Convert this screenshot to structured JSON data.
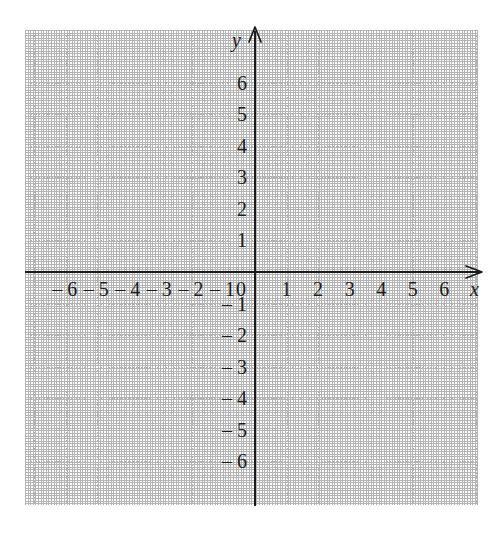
{
  "chart_data": {
    "type": "scatter",
    "title": "",
    "subtitle": "",
    "xlabel": "x",
    "ylabel": "y",
    "xlim": [
      -7,
      7
    ],
    "ylim": [
      -7,
      7
    ],
    "grid": true,
    "legend": null,
    "series": [],
    "annotations": [],
    "x_ticks": [
      {
        "value": -6,
        "label": "– 6"
      },
      {
        "value": -5,
        "label": "– 5"
      },
      {
        "value": -4,
        "label": "– 4"
      },
      {
        "value": -3,
        "label": "– 3"
      },
      {
        "value": -2,
        "label": "– 2"
      },
      {
        "value": -1,
        "label": "– 1"
      },
      {
        "value": 0,
        "label": "0"
      },
      {
        "value": 1,
        "label": "1"
      },
      {
        "value": 2,
        "label": "2"
      },
      {
        "value": 3,
        "label": "3"
      },
      {
        "value": 4,
        "label": "4"
      },
      {
        "value": 5,
        "label": "5"
      },
      {
        "value": 6,
        "label": "6"
      }
    ],
    "y_ticks": [
      {
        "value": 6,
        "label": "6"
      },
      {
        "value": 5,
        "label": "5"
      },
      {
        "value": 4,
        "label": "4"
      },
      {
        "value": 3,
        "label": "3"
      },
      {
        "value": 2,
        "label": "2"
      },
      {
        "value": 1,
        "label": "1"
      },
      {
        "value": -1,
        "label": "– 1"
      },
      {
        "value": -2,
        "label": "– 2"
      },
      {
        "value": -3,
        "label": "– 3"
      },
      {
        "value": -4,
        "label": "– 4"
      },
      {
        "value": -5,
        "label": "– 5"
      },
      {
        "value": -6,
        "label": "– 6"
      }
    ],
    "origin_label": "0",
    "x_axis_name": "x",
    "y_axis_name": "y",
    "colors": {
      "background": "#ffffff",
      "grid": "#b0b0b0",
      "axis": "#1a1a1a",
      "label": "#1c1c1c"
    }
  }
}
